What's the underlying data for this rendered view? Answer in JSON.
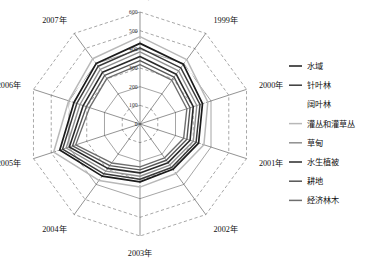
{
  "chart_data": {
    "type": "line",
    "subtype": "radar",
    "title": "",
    "xlabel": "",
    "ylabel": "",
    "grid": true,
    "legend_position": "right",
    "radial_axis": {
      "min": 0,
      "max": 600,
      "tick_step": 100,
      "tick_labels": [
        "0",
        "100",
        "200",
        "300",
        "400",
        "500",
        "600"
      ],
      "tick_values": [
        0,
        100,
        200,
        300,
        400,
        500,
        600
      ],
      "tick_axis_angle_deg": 90,
      "ring_styles": [
        "solid",
        "dashed",
        "solid",
        "dashed",
        "solid",
        "dashed",
        "dashed"
      ]
    },
    "categories": [
      "1998年",
      "1999年",
      "2000年",
      "2001年",
      "2002年",
      "2003年",
      "2004年",
      "2005年",
      "2006年",
      "2007年"
    ],
    "series": [
      {
        "name": "水域",
        "color": "#1b1b1b",
        "width": 1.7,
        "values": [
          432,
          395,
          352,
          330,
          300,
          310,
          345,
          452,
          372,
          400
        ]
      },
      {
        "name": "针叶林",
        "color": "#3a3a3a",
        "width": 1.5,
        "values": [
          408,
          372,
          338,
          316,
          288,
          296,
          330,
          436,
          356,
          382
        ]
      },
      {
        "name": "阔叶林",
        "color": "#fdfdfd",
        "width": 1.3,
        "values": [
          452,
          412,
          368,
          346,
          314,
          324,
          360,
          470,
          388,
          418
        ]
      },
      {
        "name": "灌丛和灌草丛",
        "color": "#b8b8b8",
        "width": 1.5,
        "values": [
          468,
          426,
          382,
          360,
          328,
          338,
          374,
          486,
          402,
          432
        ]
      },
      {
        "name": "草甸",
        "color": "#8f8f8f",
        "width": 1.4,
        "values": [
          386,
          352,
          320,
          300,
          272,
          280,
          312,
          416,
          338,
          362
        ]
      },
      {
        "name": "水生植被",
        "color": "#2a2a2a",
        "width": 1.6,
        "values": [
          362,
          330,
          300,
          282,
          256,
          262,
          294,
          398,
          320,
          342
        ]
      },
      {
        "name": "耕地",
        "color": "#555555",
        "width": 1.4,
        "values": [
          340,
          310,
          282,
          264,
          240,
          246,
          276,
          380,
          302,
          322
        ]
      },
      {
        "name": "经济林木",
        "color": "#6e6e6e",
        "width": 1.4,
        "values": [
          318,
          290,
          264,
          246,
          224,
          230,
          258,
          362,
          284,
          302
        ]
      }
    ]
  },
  "legend": {
    "items": [
      {
        "label": "水域",
        "color": "#1b1b1b",
        "has_marker": true
      },
      {
        "label": "针叶林",
        "color": "#3a3a3a",
        "has_marker": true
      },
      {
        "label": "阔叶林",
        "color": "#fdfdfd",
        "has_marker": false
      },
      {
        "label": "灌丛和灌草丛",
        "color": "#b8b8b8",
        "has_marker": true
      },
      {
        "label": "草甸",
        "color": "#8f8f8f",
        "has_marker": true
      },
      {
        "label": "水生植被",
        "color": "#2a2a2a",
        "has_marker": true
      },
      {
        "label": "耕地",
        "color": "#555555",
        "has_marker": true
      },
      {
        "label": "经济林木",
        "color": "#6e6e6e",
        "has_marker": true
      }
    ]
  },
  "geometry": {
    "center_x": 140,
    "center_y": 124,
    "outer_radius": 112,
    "start_angle_deg": -90,
    "legend_x": 289,
    "legend_line_len": 13,
    "legend_text_x": 307,
    "legend_y_start": 66,
    "legend_y_step": 19.2
  }
}
